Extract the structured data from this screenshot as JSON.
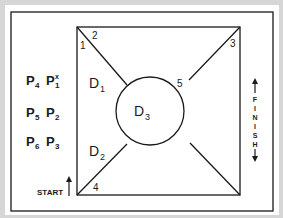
{
  "diagram": {
    "colors": {
      "background": "#d6d6d6",
      "panel": "#ffffff",
      "stroke": "#1a1a1a"
    },
    "corner_labels": [
      {
        "id": "1",
        "text": "1"
      },
      {
        "id": "2",
        "text": "2"
      },
      {
        "id": "3",
        "text": "3"
      },
      {
        "id": "4",
        "text": "4"
      },
      {
        "id": "5",
        "text": "5"
      }
    ],
    "regions": [
      {
        "id": "D1",
        "base": "D",
        "sub": "1"
      },
      {
        "id": "D2",
        "base": "D",
        "sub": "2"
      },
      {
        "id": "D3",
        "base": "D",
        "sub": "3"
      }
    ],
    "players": [
      {
        "row": 1,
        "left": {
          "base": "P",
          "sub": "4"
        },
        "right": {
          "base": "P",
          "sub": "1",
          "sup": "x"
        }
      },
      {
        "row": 2,
        "left": {
          "base": "P",
          "sub": "5"
        },
        "right": {
          "base": "P",
          "sub": "2"
        }
      },
      {
        "row": 3,
        "left": {
          "base": "P",
          "sub": "6"
        },
        "right": {
          "base": "P",
          "sub": "3"
        }
      }
    ],
    "start_label": "START",
    "finish_letters": [
      "F",
      "I",
      "N",
      "I",
      "S",
      "H"
    ],
    "icons": {
      "start_arrow": "arrow-up-icon",
      "finish_arrow_top": "arrow-up-icon",
      "finish_arrow_bottom": "arrow-down-icon"
    }
  }
}
